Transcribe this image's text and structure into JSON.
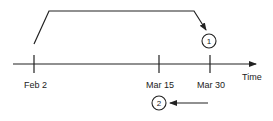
{
  "diagram": {
    "axis": {
      "label": "Time",
      "color": "#222222"
    },
    "ticks": [
      {
        "label": "Feb 2"
      },
      {
        "label": "Mar 15"
      },
      {
        "label": "Mar 30"
      }
    ],
    "markers": [
      {
        "number": "1"
      },
      {
        "number": "2"
      }
    ]
  }
}
